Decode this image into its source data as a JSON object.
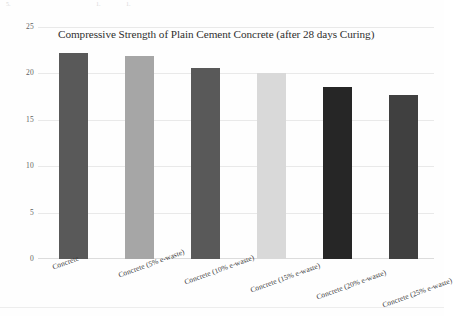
{
  "document": {
    "scan_artifacts": [
      "5.",
      "1.",
      "1."
    ]
  },
  "chart_data": {
    "type": "bar",
    "title": "Compressive Strength of Plain Cement Concrete (after 28 days Curing)",
    "xlabel": "",
    "ylabel": "",
    "ylim": [
      0,
      25
    ],
    "yticks": [
      25,
      20,
      15,
      10,
      5,
      0
    ],
    "grid": true,
    "legend": "none",
    "categories": [
      "Concrete",
      "Concrete (5% e-waste)",
      "Concrete (10% e-waste)",
      "Concrete (15% e-waste)",
      "Concrete (20% e-waste)",
      "Concrete (25% e-waste)"
    ],
    "values": [
      22.2,
      21.9,
      20.6,
      20.0,
      18.5,
      17.7
    ],
    "colors": [
      "#595959",
      "#a6a6a6",
      "#595959",
      "#d9d9d9",
      "#262626",
      "#404040"
    ]
  }
}
